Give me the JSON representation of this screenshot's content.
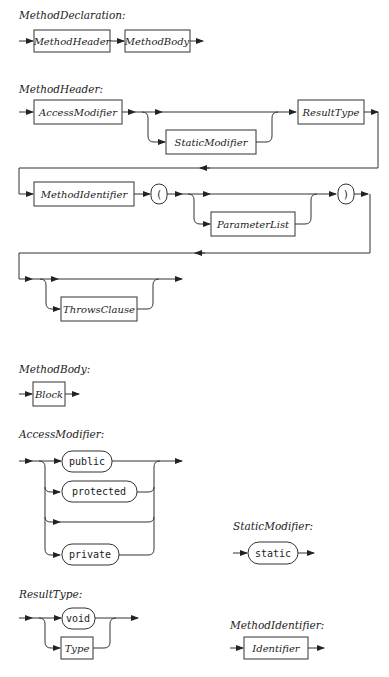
{
  "rules": {
    "method_declaration": {
      "title": "MethodDeclaration:",
      "items": [
        "MethodHeader",
        "MethodBody"
      ]
    },
    "method_header": {
      "title": "MethodHeader:",
      "access_modifier": "AccessModifier",
      "static_modifier": "StaticModifier",
      "result_type": "ResultType",
      "method_identifier": "MethodIdentifier",
      "open_paren": "(",
      "parameter_list": "ParameterList",
      "close_paren": ")",
      "throws_clause": "ThrowsClause"
    },
    "method_body": {
      "title": "MethodBody:",
      "block": "Block"
    },
    "access_modifier": {
      "title": "AccessModifier:",
      "options": [
        "public",
        "protected",
        "private"
      ]
    },
    "static_modifier": {
      "title": "StaticModifier:",
      "keyword": "static"
    },
    "result_type": {
      "title": "ResultType:",
      "keyword": "void",
      "type": "Type"
    },
    "method_identifier": {
      "title": "MethodIdentifier:",
      "identifier": "Identifier"
    }
  }
}
